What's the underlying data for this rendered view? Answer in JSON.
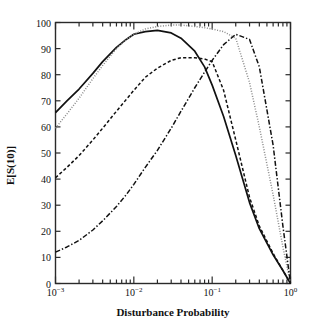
{
  "chart_data": {
    "type": "line",
    "title": "",
    "xlabel": "Disturbance Probability",
    "ylabel": "E[S(10)]",
    "xscale": "log",
    "yscale": "linear",
    "xlim": [
      0.001,
      1.0
    ],
    "ylim": [
      0,
      100
    ],
    "grid": false,
    "legend": "none",
    "xtick_labels": [
      "10-3",
      "10-2",
      "10-1",
      "100"
    ],
    "xtick_values": [
      0.001,
      0.01,
      0.1,
      1.0
    ],
    "ytick_labels": [
      "0",
      "10",
      "20",
      "30",
      "40",
      "50",
      "60",
      "70",
      "80",
      "90",
      "100"
    ],
    "ytick_values": [
      0,
      10,
      20,
      30,
      40,
      50,
      60,
      70,
      80,
      90,
      100
    ],
    "series": [
      {
        "name": "solid-curve",
        "style": "solid",
        "color": "#111111",
        "x": [
          0.001,
          0.0014,
          0.002,
          0.003,
          0.004,
          0.006,
          0.008,
          0.01,
          0.014,
          0.02,
          0.03,
          0.04,
          0.06,
          0.08,
          0.1,
          0.14,
          0.2,
          0.3,
          0.4,
          0.6,
          0.8,
          1.0
        ],
        "y": [
          65.5,
          70.0,
          74.5,
          80.5,
          85.0,
          90.5,
          93.5,
          95.5,
          96.5,
          97.0,
          96.0,
          94.0,
          89.0,
          83.0,
          76.0,
          64.0,
          49.0,
          31.0,
          21.0,
          11.0,
          5.0,
          0.0
        ]
      },
      {
        "name": "dotted-curve",
        "style": "dotted",
        "color": "#8a8a8a",
        "x": [
          0.001,
          0.0014,
          0.002,
          0.003,
          0.004,
          0.006,
          0.008,
          0.01,
          0.014,
          0.02,
          0.03,
          0.04,
          0.06,
          0.08,
          0.1,
          0.14,
          0.2,
          0.3,
          0.4,
          0.6,
          0.8,
          1.0
        ],
        "y": [
          59.5,
          65.0,
          71.0,
          78.5,
          83.5,
          90.0,
          93.5,
          95.5,
          97.5,
          98.5,
          99.0,
          99.0,
          98.5,
          98.0,
          97.5,
          96.5,
          94.0,
          77.0,
          60.0,
          34.0,
          14.0,
          0.0
        ]
      },
      {
        "name": "dashed-curve",
        "style": "dashed",
        "color": "#111111",
        "x": [
          0.001,
          0.0014,
          0.002,
          0.003,
          0.004,
          0.006,
          0.008,
          0.01,
          0.014,
          0.02,
          0.03,
          0.04,
          0.06,
          0.08,
          0.1,
          0.14,
          0.2,
          0.3,
          0.4,
          0.6,
          0.8,
          1.0
        ],
        "y": [
          40.5,
          44.5,
          49.0,
          55.0,
          59.5,
          66.0,
          70.5,
          74.0,
          79.0,
          82.5,
          85.5,
          86.5,
          86.5,
          86.0,
          85.0,
          74.0,
          55.0,
          33.0,
          22.0,
          11.5,
          5.0,
          0.0
        ]
      },
      {
        "name": "dash-dot-curve",
        "style": "dash-dot",
        "color": "#111111",
        "x": [
          0.001,
          0.0014,
          0.002,
          0.003,
          0.004,
          0.006,
          0.008,
          0.01,
          0.014,
          0.02,
          0.03,
          0.04,
          0.06,
          0.08,
          0.1,
          0.14,
          0.2,
          0.3,
          0.4,
          0.6,
          0.8,
          1.0
        ],
        "y": [
          12.0,
          14.0,
          16.5,
          20.5,
          24.0,
          29.5,
          34.0,
          38.0,
          44.5,
          51.0,
          59.5,
          66.0,
          75.0,
          81.0,
          85.5,
          91.5,
          95.5,
          93.5,
          83.0,
          53.0,
          22.0,
          0.0
        ]
      }
    ]
  },
  "axes": {
    "ylabel": "E[S(10)]",
    "xlabel": "Disturbance Probability"
  }
}
